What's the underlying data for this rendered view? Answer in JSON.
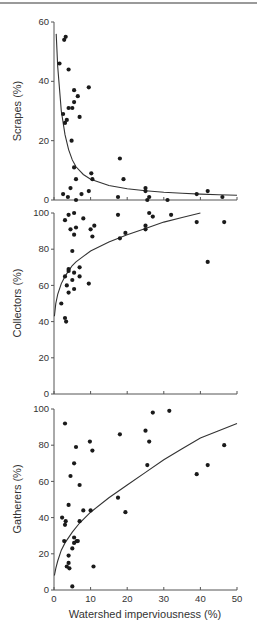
{
  "chart_data": [
    {
      "type": "scatter",
      "title": "",
      "xlabel": "",
      "ylabel": "Scrapes (%)",
      "xlim": [
        0,
        50
      ],
      "ylim": [
        0,
        60
      ],
      "yticks": [
        0,
        20,
        40,
        60
      ],
      "xticks": [
        0,
        10,
        20,
        30,
        40,
        50
      ],
      "grid": false,
      "fit": "power-decay",
      "fit_curve": [
        [
          0.6,
          56
        ],
        [
          1,
          45
        ],
        [
          2,
          30
        ],
        [
          3,
          22
        ],
        [
          4,
          17
        ],
        [
          5,
          13.5
        ],
        [
          6,
          11.2
        ],
        [
          8,
          8.6
        ],
        [
          10,
          7
        ],
        [
          15,
          4.9
        ],
        [
          20,
          3.8
        ],
        [
          25,
          3.1
        ],
        [
          30,
          2.6
        ],
        [
          35,
          2.3
        ],
        [
          40,
          2
        ],
        [
          45,
          1.8
        ],
        [
          50,
          1.6
        ]
      ],
      "points": [
        [
          2.8,
          54
        ],
        [
          3.2,
          55
        ],
        [
          1.5,
          46
        ],
        [
          4,
          44
        ],
        [
          2.5,
          29
        ],
        [
          3,
          26
        ],
        [
          3.5,
          27
        ],
        [
          4,
          31
        ],
        [
          5,
          31
        ],
        [
          5.5,
          37
        ],
        [
          5.5,
          33
        ],
        [
          6.5,
          35
        ],
        [
          7,
          28
        ],
        [
          9.5,
          38
        ],
        [
          4.8,
          20
        ],
        [
          5.5,
          11
        ],
        [
          6,
          7
        ],
        [
          4.5,
          4
        ],
        [
          2.5,
          2
        ],
        [
          3.8,
          1
        ],
        [
          6,
          0
        ],
        [
          7.5,
          2
        ],
        [
          9.5,
          3
        ],
        [
          10.2,
          9
        ],
        [
          10.5,
          7
        ],
        [
          18,
          14
        ],
        [
          19,
          7
        ],
        [
          17.5,
          1
        ],
        [
          25,
          3
        ],
        [
          25,
          4
        ],
        [
          26,
          1
        ],
        [
          25.5,
          0
        ],
        [
          31,
          0
        ],
        [
          39,
          2
        ],
        [
          42,
          3
        ],
        [
          46,
          1
        ]
      ]
    },
    {
      "type": "scatter",
      "title": "",
      "xlabel": "",
      "ylabel": "Collectors (%)",
      "xlim": [
        0,
        50
      ],
      "ylim": [
        0,
        100
      ],
      "yticks": [
        0,
        20,
        40,
        60,
        80,
        100
      ],
      "xticks": [
        0,
        10,
        20,
        30,
        40,
        50
      ],
      "grid": false,
      "fit": "logarithmic",
      "fit_curve": [
        [
          0.1,
          43
        ],
        [
          0.5,
          50
        ],
        [
          1,
          55
        ],
        [
          2,
          61
        ],
        [
          3,
          65
        ],
        [
          4,
          68
        ],
        [
          5,
          71
        ],
        [
          6,
          73
        ],
        [
          8,
          76
        ],
        [
          10,
          79
        ],
        [
          15,
          84
        ],
        [
          20,
          88
        ],
        [
          25,
          91.5
        ],
        [
          30,
          95
        ],
        [
          35,
          97.5
        ],
        [
          40,
          100
        ]
      ],
      "points": [
        [
          3,
          96
        ],
        [
          4,
          99
        ],
        [
          5.5,
          100
        ],
        [
          4.5,
          91
        ],
        [
          5.5,
          88
        ],
        [
          6,
          92
        ],
        [
          8,
          97
        ],
        [
          10,
          91
        ],
        [
          11,
          93
        ],
        [
          10.5,
          87
        ],
        [
          5,
          79
        ],
        [
          3,
          65
        ],
        [
          4,
          69
        ],
        [
          4,
          68
        ],
        [
          3.5,
          60
        ],
        [
          5,
          63
        ],
        [
          5.5,
          67
        ],
        [
          5.5,
          58
        ],
        [
          4,
          56
        ],
        [
          7,
          70
        ],
        [
          7,
          65
        ],
        [
          9.5,
          61
        ],
        [
          2,
          50
        ],
        [
          3,
          42
        ],
        [
          3.3,
          40
        ],
        [
          17.5,
          99
        ],
        [
          18,
          86
        ],
        [
          19.5,
          89
        ],
        [
          25,
          93
        ],
        [
          25,
          91
        ],
        [
          26,
          100
        ],
        [
          27,
          98
        ],
        [
          32,
          99
        ],
        [
          39,
          95
        ],
        [
          42,
          73
        ],
        [
          46.5,
          95
        ]
      ]
    },
    {
      "type": "scatter",
      "title": "",
      "xlabel": "Watershed imperviousness (%)",
      "ylabel": "Gatherers (%)",
      "xlim": [
        0,
        50
      ],
      "ylim": [
        0,
        100
      ],
      "yticks": [
        0,
        20,
        40,
        60,
        80,
        100
      ],
      "xticks": [
        0,
        10,
        20,
        30,
        40,
        50
      ],
      "grid": false,
      "fit": "power-growth",
      "fit_curve": [
        [
          0.1,
          8
        ],
        [
          0.5,
          12
        ],
        [
          1,
          16
        ],
        [
          2,
          22
        ],
        [
          3,
          26
        ],
        [
          5,
          32
        ],
        [
          7,
          37
        ],
        [
          10,
          43
        ],
        [
          15,
          51
        ],
        [
          20,
          58
        ],
        [
          25,
          65
        ],
        [
          30,
          72
        ],
        [
          35,
          78
        ],
        [
          40,
          84
        ],
        [
          45,
          88
        ],
        [
          50,
          92
        ]
      ],
      "points": [
        [
          3,
          92
        ],
        [
          6,
          79
        ],
        [
          9.8,
          82
        ],
        [
          10.5,
          77
        ],
        [
          5.5,
          70
        ],
        [
          4.5,
          63
        ],
        [
          7,
          58
        ],
        [
          4,
          47
        ],
        [
          8,
          44
        ],
        [
          10,
          44
        ],
        [
          2.2,
          40
        ],
        [
          3.2,
          38
        ],
        [
          3,
          36
        ],
        [
          7,
          38
        ],
        [
          2.8,
          27
        ],
        [
          5.5,
          29
        ],
        [
          5.5,
          26
        ],
        [
          6.2,
          27
        ],
        [
          6.5,
          27
        ],
        [
          5,
          23
        ],
        [
          4,
          19
        ],
        [
          4,
          15
        ],
        [
          3.5,
          13
        ],
        [
          4.2,
          12
        ],
        [
          10.8,
          13
        ],
        [
          5,
          2
        ],
        [
          18,
          86
        ],
        [
          17.5,
          51
        ],
        [
          19.5,
          43
        ],
        [
          25,
          88
        ],
        [
          26,
          82
        ],
        [
          25.5,
          69
        ],
        [
          27,
          98
        ],
        [
          31.5,
          99
        ],
        [
          39,
          64
        ],
        [
          42,
          69
        ],
        [
          46.5,
          80
        ]
      ]
    }
  ],
  "panels": [
    {
      "ylabel": "Scrapes (%)",
      "yticks": [
        "0",
        "20",
        "40",
        "60"
      ]
    },
    {
      "ylabel": "Collectors (%)",
      "yticks": [
        "0",
        "20",
        "40",
        "60",
        "80",
        "100"
      ]
    },
    {
      "ylabel": "Gatherers (%)",
      "yticks": [
        "0",
        "20",
        "40",
        "60",
        "80",
        "100"
      ]
    }
  ],
  "x_axis": {
    "label": "Watershed imperviousness (%)",
    "ticks": [
      "0",
      "10",
      "20",
      "30",
      "40",
      "50"
    ]
  },
  "colors": {
    "points": "#1a1a1a",
    "axes": "#555555",
    "fit_line": "#333333",
    "text": "#333333"
  }
}
